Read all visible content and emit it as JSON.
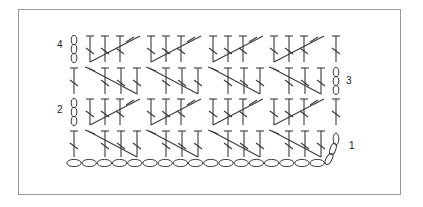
{
  "diagram": {
    "type": "crochet-stitch-chart",
    "frame": {
      "border_color": "#9a9a9a",
      "background": "#ffffff"
    },
    "stroke_color": "#3a3a3a",
    "row_labels": [
      {
        "row": 1,
        "text": "1",
        "side": "right"
      },
      {
        "row": 2,
        "text": "2",
        "side": "left"
      },
      {
        "row": 3,
        "text": "3",
        "side": "right"
      },
      {
        "row": 4,
        "text": "4",
        "side": "left"
      }
    ],
    "foundation_chain_count": 17,
    "turning_chain_length": 3,
    "clusters_per_row": 4,
    "cluster_stitches": 3,
    "legend": {
      "chain": "oval",
      "double_crochet": "T with slash"
    }
  }
}
